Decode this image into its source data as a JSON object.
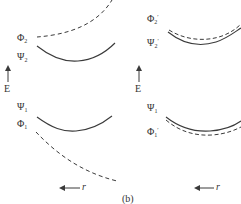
{
  "caption": "(b)",
  "colors": {
    "line": "#3a3a3a",
    "text": "#333333",
    "background": "#ffffff"
  },
  "left_panel": {
    "energy_axis_label": "E",
    "r_axis_label": "r",
    "curves": [
      {
        "name": "Phi_2",
        "symbol": "Φ",
        "sub": "2",
        "sup": "",
        "style": "dashed"
      },
      {
        "name": "Psi_2",
        "symbol": "Ψ",
        "sub": "2",
        "sup": "",
        "style": "solid"
      },
      {
        "name": "Psi_1",
        "symbol": "Ψ",
        "sub": "1",
        "sup": "",
        "style": "solid"
      },
      {
        "name": "Phi_1",
        "symbol": "Φ",
        "sub": "1",
        "sup": "",
        "style": "dashed"
      }
    ]
  },
  "right_panel": {
    "energy_axis_label": "E",
    "r_axis_label": "r",
    "curves": [
      {
        "name": "Phi_2_prime",
        "symbol": "Φ",
        "sub": "2",
        "sup": "′",
        "style": "dashed"
      },
      {
        "name": "Psi_2_prime",
        "symbol": "Ψ",
        "sub": "2",
        "sup": "′",
        "style": "solid"
      },
      {
        "name": "Psi_1",
        "symbol": "Ψ",
        "sub": "1",
        "sup": "",
        "style": "solid"
      },
      {
        "name": "Phi_1_prime",
        "symbol": "Φ",
        "sub": "1",
        "sup": "′",
        "style": "dashed"
      }
    ]
  }
}
